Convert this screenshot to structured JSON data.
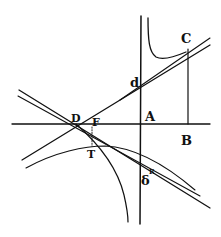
{
  "figure": {
    "stroke_color": "#111111",
    "background": "#ffffff",
    "labels": {
      "A": "A",
      "B": "B",
      "C": "C",
      "D": "D",
      "F": "F",
      "T": "T",
      "d": "d",
      "delta": "δ",
      "R": "R"
    }
  }
}
